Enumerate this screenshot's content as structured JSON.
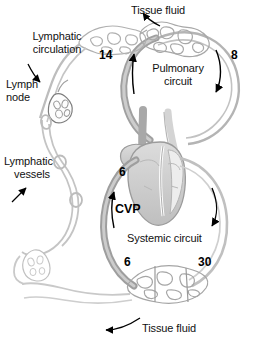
{
  "figure": {
    "type": "anatomical-schematic",
    "width": 255,
    "height": 346,
    "background_color": "#ffffff",
    "line_color": "#9a9a9a",
    "dark_line_color": "#6e6e6e",
    "text_color": "#111111"
  },
  "labels": {
    "tissue_fluid_top": "Tissue fluid",
    "tissue_fluid_bottom": "Tissue fluid",
    "lymphatic_circulation_line1": "Lymphatic",
    "lymphatic_circulation_line2": "circulation",
    "lymph_node_line1": "Lymph",
    "lymph_node_line2": "node",
    "lymphatic_vessels_line1": "Lymphatic",
    "lymphatic_vessels_line2": "vessels",
    "pulmonary_circuit_line1": "Pulmonary",
    "pulmonary_circuit_line2": "circuit",
    "systemic_circuit": "Systemic circuit",
    "cvp": "CVP"
  },
  "pressure_values": {
    "pulmonary_capillary_inflow": "14",
    "pulmonary_outflow": "8",
    "right_atrium_cvp": "6",
    "systemic_venous_return": "6",
    "systemic_arterial": "30"
  },
  "icons": {
    "arrow_tissue_fluid_top": "arrow-down-left-icon",
    "arrow_tissue_fluid_bottom": "arrow-left-icon",
    "arrow_lymph_node": "arrow-down-icon",
    "arrow_lymphatic_vessels": "arrow-up-right-icon",
    "arrow_pulmonary_up": "arrow-up-icon",
    "arrow_pulmonary_down": "arrow-down-icon",
    "arrow_systemic_up": "arrow-up-icon",
    "arrow_systemic_down": "arrow-down-icon"
  }
}
